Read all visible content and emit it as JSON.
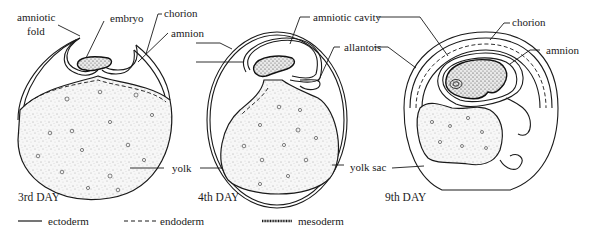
{
  "figure": {
    "stages": [
      {
        "id": "day3",
        "caption": "3rd DAY",
        "labels": {
          "amniotic_fold_line1": "amniotic",
          "amniotic_fold_line2": "fold",
          "embryo": "embryo",
          "chorion": "chorion",
          "amnion": "amnion",
          "yolk": "yolk"
        }
      },
      {
        "id": "day4",
        "caption": "4th DAY",
        "labels": {
          "amniotic_cavity": "amniotic cavity",
          "allantois": "allantois",
          "yolk_sac": "yolk sac"
        }
      },
      {
        "id": "day9",
        "caption": "9th DAY",
        "labels": {
          "chorion": "chorion",
          "amnion": "amnion"
        }
      }
    ],
    "legend": [
      {
        "style": "solid",
        "label": "ectoderm"
      },
      {
        "style": "dashed",
        "label": "endoderm"
      },
      {
        "style": "dotted-thick",
        "label": "mesoderm"
      }
    ]
  }
}
